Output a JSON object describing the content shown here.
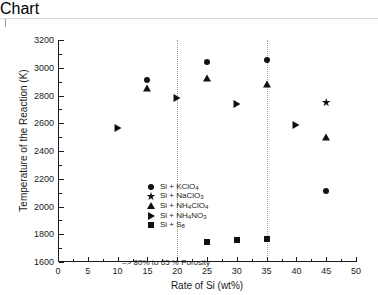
{
  "chart_data": {
    "type": "scatter",
    "title": "",
    "xlabel": "Rate of Si (wt%)",
    "ylabel": "Temperature of the Reaction (K)",
    "xlim": [
      0,
      50
    ],
    "ylim": [
      1600,
      3200
    ],
    "xticks": [
      0,
      5,
      10,
      15,
      20,
      25,
      30,
      35,
      40,
      45,
      50
    ],
    "yticks": [
      1600,
      1800,
      2000,
      2200,
      2400,
      2600,
      2800,
      3000,
      3200
    ],
    "x_minor_step": 2.5,
    "y_minor_step": 100,
    "grid": false,
    "legend_position": "center-left-inside",
    "reference_lines": [
      {
        "axis": "x",
        "value": 20,
        "style": "dotted"
      },
      {
        "axis": "x",
        "value": 35,
        "style": "dotted"
      }
    ],
    "annotations": [
      {
        "text": "=> 80% to 65 % Porosity",
        "x": 3.5,
        "y": 1770
      }
    ],
    "series": [
      {
        "name": "Si + KClO4",
        "label_html": "Si + KClO<sub>4</sub>",
        "marker": "circle",
        "color": "#111111",
        "points": [
          {
            "x": 15,
            "y": 2912
          },
          {
            "x": 25,
            "y": 3040
          },
          {
            "x": 35,
            "y": 3055
          },
          {
            "x": 45,
            "y": 2115
          }
        ]
      },
      {
        "name": "Si + NaClO3",
        "label_html": "Si + NaClO<sub>3</sub>",
        "marker": "star",
        "color": "#111111",
        "points": [
          {
            "x": 45,
            "y": 2750
          }
        ]
      },
      {
        "name": "Si + NH4ClO4",
        "label_html": "Si + NH<sub>4</sub>ClO<sub>4</sub>",
        "marker": "triangle",
        "color": "#111111",
        "points": [
          {
            "x": 15,
            "y": 2855
          },
          {
            "x": 25,
            "y": 2925
          },
          {
            "x": 35,
            "y": 2880
          },
          {
            "x": 45,
            "y": 2500
          }
        ]
      },
      {
        "name": "Si + NH4NO3",
        "label_html": "Si + NH<sub>4</sub>NO<sub>3</sub>",
        "marker": "right-triangle",
        "color": "#111111",
        "points": [
          {
            "x": 10,
            "y": 2565
          },
          {
            "x": 20,
            "y": 2780
          },
          {
            "x": 30,
            "y": 2740
          },
          {
            "x": 40,
            "y": 2590
          }
        ]
      },
      {
        "name": "Si + S8",
        "label_html": "Si + S<sub>8</sub>",
        "marker": "square",
        "color": "#111111",
        "points": [
          {
            "x": 25,
            "y": 1742
          },
          {
            "x": 30,
            "y": 1762
          },
          {
            "x": 35,
            "y": 1765
          }
        ]
      }
    ]
  }
}
